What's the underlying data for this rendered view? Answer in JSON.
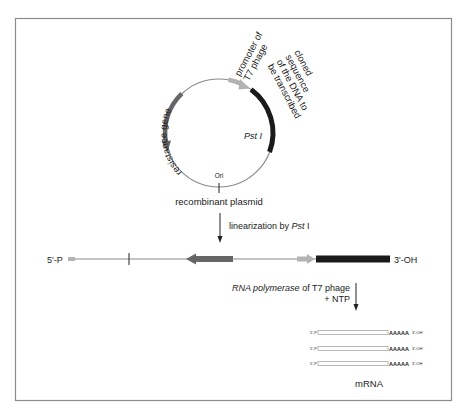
{
  "colors": {
    "frame": "#8c8c8c",
    "backbone": "#8a8a8a",
    "resistance_gene": "#666666",
    "promoter": "#b3b3b3",
    "cloned_sequence": "#1a1a1a",
    "text": "#222222",
    "mrna_box": "#c8c8c8"
  },
  "plasmid": {
    "title": "recombinant plasmid",
    "labels": {
      "resistance_gene": "resistance gene",
      "promoter_line1": "promoter of",
      "promoter_line2": "T7 phage",
      "cloned_line1": "cloned",
      "cloned_line2": "sequence",
      "cloned_line3": "of the DNA to",
      "cloned_line4": "be transcribed",
      "pst_site": "Pst I",
      "ori": "Ori"
    }
  },
  "step1": {
    "label_prefix": "linearization by ",
    "label_enzyme": "Pst",
    "label_suffix": " I"
  },
  "linear_dna": {
    "left_end": "5'-P",
    "right_end": "3'-OH"
  },
  "step2": {
    "label_italic": "RNA polymerase",
    "label_rest": " of T7 phage",
    "label_line2": "+ NTP"
  },
  "mrna": {
    "title": "mRNA",
    "transcripts": [
      {
        "left": "5'-P",
        "polyA": "AAAAA",
        "right": "3'-OH"
      },
      {
        "left": "5'-P",
        "polyA": "AAAAA",
        "right": "3'-OH"
      },
      {
        "left": "5'-P",
        "polyA": "AAAAA",
        "right": "3'-OH"
      }
    ]
  }
}
